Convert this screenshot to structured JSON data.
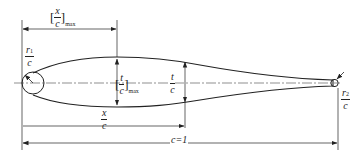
{
  "figure": {
    "labels": {
      "x_c_max": {
        "num": "x",
        "den": "c",
        "sub": "max"
      },
      "r1_c": {
        "num": "r",
        "num_sub": "1",
        "den": "c"
      },
      "t_c_max": {
        "num": "t",
        "den": "c",
        "sub": "max"
      },
      "t_c": {
        "num": "t",
        "den": "c"
      },
      "x_c": {
        "num": "x",
        "den": "c"
      },
      "chord": "c=1",
      "r2_c": {
        "num": "r",
        "num_sub": "2",
        "den": "c"
      }
    },
    "colors": {
      "line": "#222222",
      "background": "#ffffff"
    }
  }
}
